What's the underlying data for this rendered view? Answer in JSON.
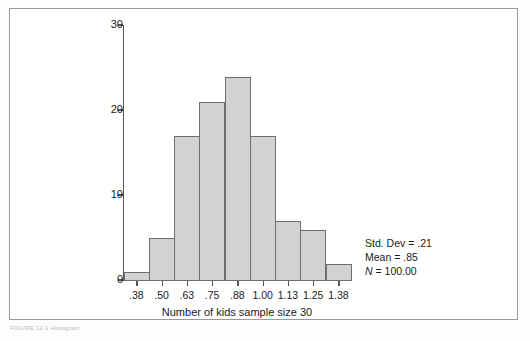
{
  "figure": {
    "caption": "FIGURE 12-1  Histogram"
  },
  "chart_data": {
    "type": "bar",
    "title": "",
    "xlabel": "Number of kids sample size 30",
    "ylabel": "",
    "categories": [
      ".38",
      ".50",
      ".63",
      ".75",
      ".88",
      "1.00",
      "1.13",
      "1.25",
      "1.38"
    ],
    "values": [
      1,
      5,
      17,
      21,
      24,
      17,
      7,
      6,
      2
    ],
    "ylim": [
      0,
      30
    ],
    "y_ticks": [
      0,
      10,
      20,
      30
    ],
    "y_tick_labels": [
      "0",
      "10",
      "20",
      "30"
    ],
    "grid": false,
    "legend": false,
    "bar_fill_color": "#d2d2d2",
    "bar_edge_color": "#6e6e6e",
    "axis_color": "#555555"
  },
  "stats": {
    "std_dev_label": "Std. Dev = .21",
    "mean_label": "Mean = .85",
    "n_symbol": "N",
    "n_value": " = 100.00"
  }
}
